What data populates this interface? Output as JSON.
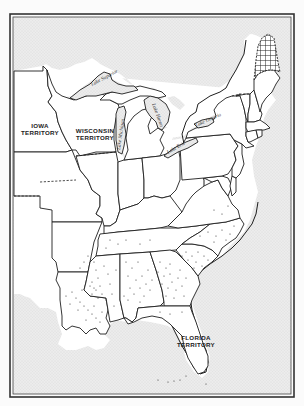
{
  "map": {
    "title": "",
    "region": "Eastern United States",
    "colors": {
      "background": "#fbfbfb",
      "water_stipple": "#e4e4e4",
      "land": "#ffffff",
      "border_line": "#1e1e1e",
      "dots": "#333333"
    },
    "labels": {
      "iowa_line1": "IOWA",
      "iowa_line2": "TERRITORY",
      "wisconsin_line1": "WISCONSIN",
      "wisconsin_line2": "TERRITORY",
      "florida_line1": "FLORIDA",
      "florida_line2": "TERRITORY",
      "lake_superior": "Lake Superior",
      "lake_michigan": "Lake Michigan",
      "lake_huron": "Lake Huron",
      "lake_erie": "Lake Erie",
      "lake_ontario": "Lake Ontario"
    },
    "features": {
      "crosshatched_area": "disputed northern Maine",
      "stippled_dots": "southern states distribution",
      "dashed_lines": "territorial / disputed boundaries"
    }
  }
}
